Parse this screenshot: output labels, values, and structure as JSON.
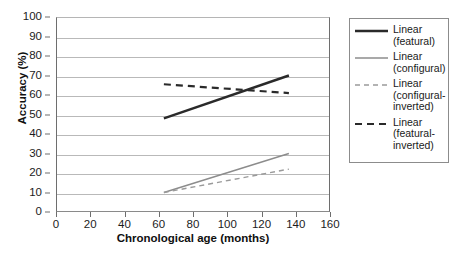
{
  "chart_data": {
    "type": "line",
    "title": "",
    "xlabel": "Chronological age (months)",
    "ylabel": "Accuracy (%)",
    "xlim": [
      0,
      160
    ],
    "ylim": [
      0,
      100
    ],
    "xticks": [
      0,
      20,
      40,
      60,
      80,
      100,
      120,
      140,
      160
    ],
    "yticks": [
      0,
      10,
      20,
      30,
      40,
      50,
      60,
      70,
      80,
      90,
      100
    ],
    "grid": "horizontal",
    "legend_position": "right-outside",
    "series": [
      {
        "name": "Linear (featural)",
        "label_lines": "Linear\n(featural)",
        "style": "solid",
        "color": "#2a2a2a",
        "width": 2.4,
        "x": [
          63,
          136
        ],
        "y": [
          48,
          70
        ]
      },
      {
        "name": "Linear (configural)",
        "label_lines": "Linear\n(configural)",
        "style": "solid",
        "color": "#8c8c8c",
        "width": 1.4,
        "x": [
          63,
          136
        ],
        "y": [
          10,
          30
        ]
      },
      {
        "name": "Linear (configural-inverted)",
        "label_lines": "Linear\n(configural-\ninverted)",
        "style": "dashed",
        "color": "#9a9a9a",
        "width": 1.4,
        "x": [
          63,
          136
        ],
        "y": [
          10,
          22
        ]
      },
      {
        "name": "Linear (featural-inverted)",
        "label_lines": "Linear\n(featural-\ninverted)",
        "style": "dashed",
        "color": "#2a2a2a",
        "width": 2.2,
        "x": [
          63,
          136
        ],
        "y": [
          65.5,
          61
        ]
      }
    ]
  },
  "axes": {
    "y_title": "Accuracy (%)",
    "x_title": "Chronological age (months)",
    "y_tick_labels": [
      "100",
      "90",
      "80",
      "70",
      "60",
      "50",
      "40",
      "30",
      "20",
      "10",
      "0"
    ],
    "x_tick_labels": [
      "0",
      "20",
      "40",
      "60",
      "80",
      "100",
      "120",
      "140",
      "160"
    ]
  },
  "legend": {
    "items": [
      {
        "label": "Linear\n(featural)",
        "style": "solid",
        "color": "#2a2a2a"
      },
      {
        "label": "Linear\n(configural)",
        "style": "solid",
        "color": "#8c8c8c"
      },
      {
        "label": "Linear\n(configural-\ninverted)",
        "style": "dashed",
        "color": "#9a9a9a"
      },
      {
        "label": "Linear\n(featural-\ninverted)",
        "style": "dashed",
        "color": "#2a2a2a"
      }
    ]
  }
}
